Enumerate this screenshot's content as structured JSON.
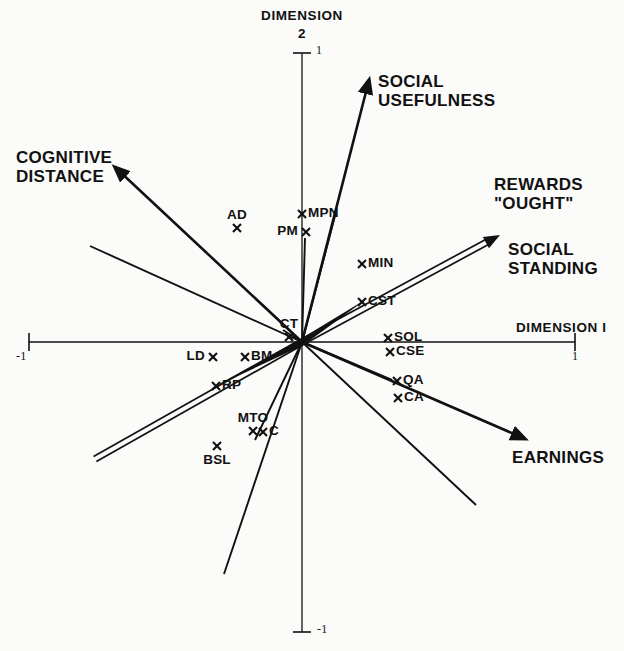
{
  "figure": {
    "type": "mds-biplot",
    "background_color": "#fbfbf9",
    "ink_color": "#111111"
  },
  "axes": {
    "vertical": {
      "title": "DIMENSION",
      "title_number": "2",
      "top_tick_label": "1",
      "bottom_tick_label": "-1",
      "x": 302,
      "top_y": 53,
      "bottom_y": 632
    },
    "horizontal": {
      "title": "DIMENSION I",
      "left_tick_label": "-1",
      "right_tick_label": "1",
      "y": 342,
      "left_x": 29,
      "right_x": 575
    },
    "origin": {
      "x": 302,
      "y": 342
    }
  },
  "vector_labels": [
    {
      "name": "social-usefulness",
      "text": "SOCIAL\nUSEFULNESS",
      "x": 378,
      "y": 72,
      "align": "left"
    },
    {
      "name": "cognitive-distance",
      "text": "COGNITIVE\nDISTANCE",
      "x": 16,
      "y": 148,
      "align": "left"
    },
    {
      "name": "rewards-ought",
      "text": "REWARDS\n\"OUGHT\"",
      "x": 494,
      "y": 175,
      "align": "left"
    },
    {
      "name": "social-standing",
      "text": "SOCIAL\nSTANDING",
      "x": 508,
      "y": 240,
      "align": "left"
    },
    {
      "name": "earnings",
      "text": "EARNINGS",
      "x": 512,
      "y": 448,
      "align": "left"
    }
  ],
  "chart_data": {
    "type": "scatter",
    "title": "",
    "xlabel": "DIMENSION I",
    "ylabel": "DIMENSION 2",
    "xlim": [
      -1,
      1
    ],
    "ylim": [
      -1,
      1
    ],
    "grid": false,
    "legend": "none",
    "marker": "x",
    "points": [
      {
        "label": "AD",
        "px": 237,
        "py": 228,
        "x": -0.238,
        "y": 0.394,
        "label_pos": "above"
      },
      {
        "label": "MPN",
        "px": 302,
        "py": 214,
        "x": 0.0,
        "y": 0.442,
        "label_pos": "right"
      },
      {
        "label": "PM",
        "px": 306,
        "py": 232,
        "x": 0.015,
        "y": 0.38,
        "label_pos": "left"
      },
      {
        "label": "MIN",
        "px": 362,
        "py": 264,
        "x": 0.22,
        "y": 0.269,
        "label_pos": "right"
      },
      {
        "label": "CST",
        "px": 362,
        "py": 302,
        "x": 0.22,
        "y": 0.138,
        "label_pos": "right"
      },
      {
        "label": "CT",
        "px": 289,
        "py": 337,
        "x": -0.048,
        "y": 0.017,
        "label_pos": "above"
      },
      {
        "label": "SOL",
        "px": 388,
        "py": 338,
        "x": 0.315,
        "y": 0.014,
        "label_pos": "right"
      },
      {
        "label": "CSE",
        "px": 390,
        "py": 352,
        "x": 0.323,
        "y": -0.034,
        "label_pos": "right"
      },
      {
        "label": "LD",
        "px": 213,
        "py": 357,
        "x": -0.326,
        "y": -0.052,
        "label_pos": "left"
      },
      {
        "label": "BM",
        "px": 245,
        "py": 357,
        "x": -0.209,
        "y": -0.052,
        "label_pos": "right"
      },
      {
        "label": "QA",
        "px": 397,
        "py": 381,
        "x": 0.349,
        "y": -0.134,
        "label_pos": "right"
      },
      {
        "label": "CA",
        "px": 398,
        "py": 398,
        "x": 0.352,
        "y": -0.193,
        "label_pos": "right"
      },
      {
        "label": "RP",
        "px": 216,
        "py": 386,
        "x": -0.315,
        "y": -0.152,
        "label_pos": "right"
      },
      {
        "label": "MTO",
        "px": 253,
        "py": 431,
        "x": -0.18,
        "y": -0.307,
        "label_pos": "above"
      },
      {
        "label": "C",
        "px": 263,
        "py": 432,
        "x": -0.143,
        "y": -0.311,
        "label_pos": "right"
      },
      {
        "label": "BSL",
        "px": 217,
        "py": 446,
        "x": -0.311,
        "y": -0.359,
        "label_pos": "below"
      }
    ],
    "vectors": [
      {
        "name": "cognitive-distance",
        "label": "COGNITIVE DISTANCE",
        "x2": 118,
        "y2": 170,
        "style": "arrow-heavy"
      },
      {
        "name": "social-usefulness",
        "label": "SOCIAL USEFULNESS",
        "x2": 368,
        "y2": 84,
        "style": "arrow-heavy"
      },
      {
        "name": "rewards-ought-social-standing",
        "label": "REWARDS \"OUGHT\" / SOCIAL STANDING",
        "x2": 500,
        "y2": 235,
        "style": "double-line-arrow"
      },
      {
        "name": "earnings",
        "label": "EARNINGS",
        "x2": 521,
        "y2": 437,
        "style": "arrow-heavy"
      },
      {
        "name": "cst-ray",
        "label": "CST",
        "x2": 368,
        "y2": 298,
        "style": "tapered"
      },
      {
        "name": "rp-ray",
        "label": "RP",
        "x2": 210,
        "y2": 389,
        "style": "tapered"
      },
      {
        "name": "lower-left-double",
        "label": "",
        "x2": 95,
        "y2": 459,
        "style": "double-line"
      },
      {
        "name": "plain-ray-upper-left",
        "label": "",
        "x2": 90,
        "y2": 246,
        "style": "plain"
      },
      {
        "name": "plain-ray-ct",
        "label": "",
        "x2": 283,
        "y2": 330,
        "style": "plain"
      },
      {
        "name": "plain-ray-pm",
        "label": "",
        "x2": 305,
        "y2": 238,
        "style": "plain"
      },
      {
        "name": "plain-ray-mpn",
        "label": "",
        "x2": 336,
        "y2": 212,
        "style": "plain"
      },
      {
        "name": "plain-ray-qa",
        "label": "",
        "x2": 392,
        "y2": 380,
        "style": "plain"
      },
      {
        "name": "plain-ray-lower-right",
        "label": "",
        "x2": 476,
        "y2": 505,
        "style": "plain"
      },
      {
        "name": "plain-ray-lower-mid",
        "label": "",
        "x2": 255,
        "y2": 440,
        "style": "plain"
      },
      {
        "name": "plain-ray-lower-left-long",
        "label": "",
        "x2": 224,
        "y2": 574,
        "style": "plain"
      }
    ]
  }
}
